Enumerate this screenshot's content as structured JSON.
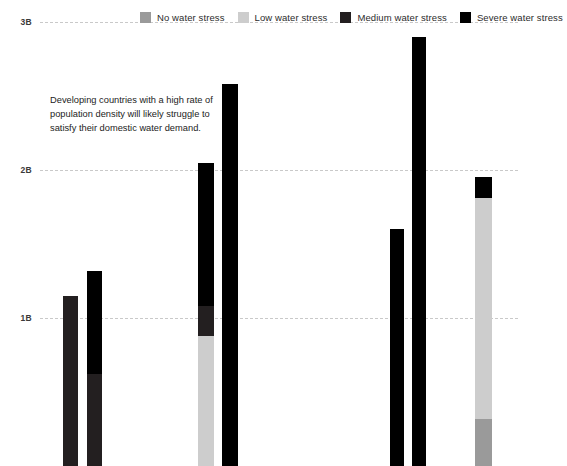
{
  "chart_data": {
    "type": "bar",
    "stacked": true,
    "title": "",
    "subtitle": "",
    "xlabel": "",
    "ylabel": "",
    "ylim": [
      0,
      3000000000
    ],
    "ytick_labels": [
      "1B",
      "2B",
      "3B"
    ],
    "ytick_values": [
      1000000000,
      2000000000,
      3000000000
    ],
    "grid": true,
    "grid_style": "dashed-horizontal",
    "legend_position": "top",
    "series": [
      {
        "name": "No water stress",
        "color": "#9a9a9a"
      },
      {
        "name": "Low water stress",
        "color": "#cdcdcd"
      },
      {
        "name": "Medium water stress",
        "color": "#231f20"
      },
      {
        "name": "Severe water stress",
        "color": "#000000"
      }
    ],
    "categories": [
      "",
      "",
      "",
      "",
      "",
      "",
      ""
    ],
    "bars": [
      {
        "x_px": 63,
        "width_px": 15,
        "segments": [
          {
            "series": "Medium water stress",
            "value": 1150000000
          }
        ]
      },
      {
        "x_px": 87,
        "width_px": 15,
        "segments": [
          {
            "series": "Medium water stress",
            "value": 620000000
          },
          {
            "series": "Severe water stress",
            "value": 700000000
          }
        ]
      },
      {
        "x_px": 198,
        "width_px": 16,
        "segments": [
          {
            "series": "Low water stress",
            "value": 880000000
          },
          {
            "series": "Medium water stress",
            "value": 200000000
          },
          {
            "series": "Severe water stress",
            "value": 970000000
          }
        ]
      },
      {
        "x_px": 222,
        "width_px": 16,
        "segments": [
          {
            "series": "Severe water stress",
            "value": 2580000000
          }
        ]
      },
      {
        "x_px": 390,
        "width_px": 14,
        "segments": [
          {
            "series": "Severe water stress",
            "value": 1600000000
          }
        ]
      },
      {
        "x_px": 412,
        "width_px": 14,
        "segments": [
          {
            "series": "Severe water stress",
            "value": 2900000000
          }
        ]
      },
      {
        "x_px": 475,
        "width_px": 17,
        "segments": [
          {
            "series": "No water stress",
            "value": 320000000
          },
          {
            "series": "Low water stress",
            "value": 1490000000
          },
          {
            "series": "Severe water stress",
            "value": 140000000
          }
        ]
      }
    ],
    "annotation": "Developing countries with a high rate of population density will likely struggle to satisfy their domestic water demand."
  },
  "legend": {
    "items": [
      {
        "label": "No water stress",
        "color": "#9a9a9a"
      },
      {
        "label": "Low water stress",
        "color": "#cdcdcd"
      },
      {
        "label": "Medium water stress",
        "color": "#231f20"
      },
      {
        "label": "Severe water stress",
        "color": "#000000"
      }
    ]
  },
  "axis": {
    "ticks": [
      {
        "label": "3B",
        "y_px": 22
      },
      {
        "label": "2B",
        "y_px": 170
      },
      {
        "label": "1B",
        "y_px": 318
      }
    ]
  }
}
